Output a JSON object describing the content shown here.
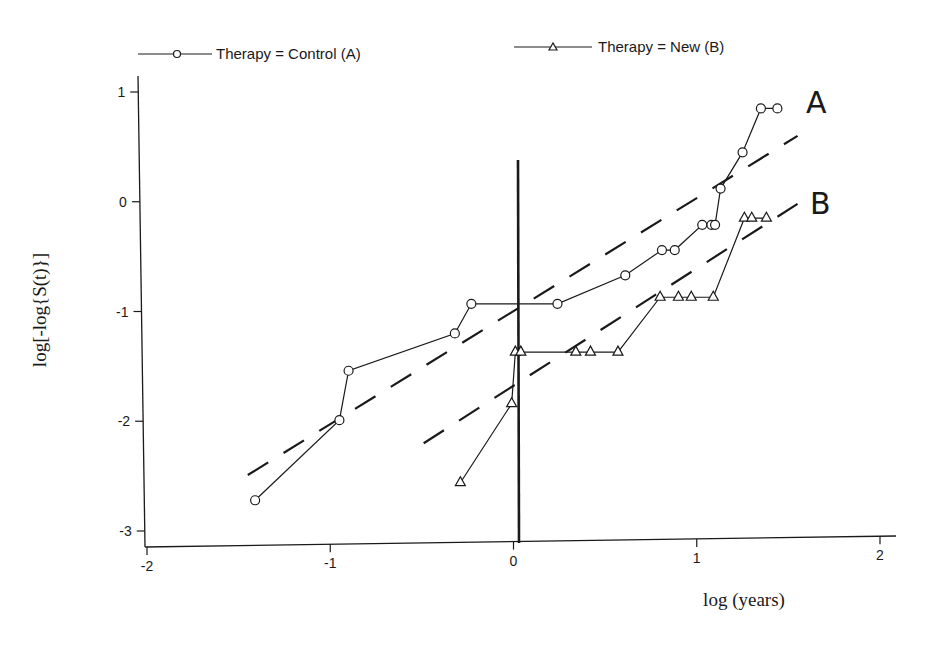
{
  "chart_data": {
    "type": "line",
    "title": "",
    "xlabel": "log (years)",
    "ylabel": "log[-log{S(t)}]",
    "xlim": [
      -2.1,
      2.1
    ],
    "ylim": [
      -3.1,
      1.1
    ],
    "x_ticks": [
      -2,
      -1,
      0,
      1,
      2
    ],
    "y_ticks": [
      1,
      0,
      -1,
      -2,
      -3
    ],
    "x_tick_labels": [
      "-2",
      "-1",
      "0",
      "1",
      "2"
    ],
    "y_tick_labels": [
      "1",
      "0",
      "-1",
      "-2",
      "-3"
    ],
    "grid": false,
    "legend_position": "top",
    "series": [
      {
        "name": "Therapy = Control (A)",
        "marker": "circle",
        "annotation": "A",
        "x": [
          -1.41,
          -0.95,
          -0.9,
          -0.32,
          -0.23,
          0.24,
          0.61,
          0.81,
          0.88,
          1.03,
          1.08,
          1.1,
          1.13,
          1.25,
          1.35,
          1.44
        ],
        "y": [
          -2.72,
          -1.99,
          -1.54,
          -1.2,
          -0.93,
          -0.93,
          -0.67,
          -0.44,
          -0.44,
          -0.21,
          -0.21,
          -0.21,
          0.12,
          0.45,
          0.85,
          0.85
        ]
      },
      {
        "name": "Therapy = New (B)",
        "marker": "triangle",
        "annotation": "B",
        "x": [
          -0.29,
          -0.01,
          0.01,
          0.04,
          0.34,
          0.42,
          0.57,
          0.8,
          0.9,
          0.97,
          1.09,
          1.26,
          1.3,
          1.38
        ],
        "y": [
          -2.56,
          -1.84,
          -1.37,
          -1.37,
          -1.37,
          -1.37,
          -1.37,
          -0.87,
          -0.87,
          -0.87,
          -0.87,
          -0.15,
          -0.15,
          -0.15
        ]
      }
    ],
    "reference_lines": [
      {
        "name": "fitted-line-A",
        "style": "dashed",
        "x": [
          -1.45,
          1.55
        ],
        "y": [
          -2.49,
          0.6
        ]
      },
      {
        "name": "fitted-line-B",
        "style": "dashed",
        "x": [
          -0.49,
          1.55
        ],
        "y": [
          -2.2,
          -0.02
        ]
      }
    ],
    "vertical_marker": {
      "x": 0,
      "y_from": -3.1,
      "y_to": 0.4
    },
    "annotations": [
      {
        "text": "A",
        "x": 1.64,
        "y": 0.9
      },
      {
        "text": "B",
        "x": 1.64,
        "y": 0.0
      }
    ]
  },
  "legend": {
    "items": [
      {
        "label": "Therapy = Control (A)"
      },
      {
        "label": "Therapy = New (B)"
      }
    ]
  },
  "axes": {
    "xlabel": "log (years)",
    "ylabel": "log[-log{S(t)}]"
  },
  "labels": {
    "curve_a": "A",
    "curve_b": "B"
  },
  "colors": {
    "ink": "#1a1a1a",
    "background": "#ffffff"
  }
}
